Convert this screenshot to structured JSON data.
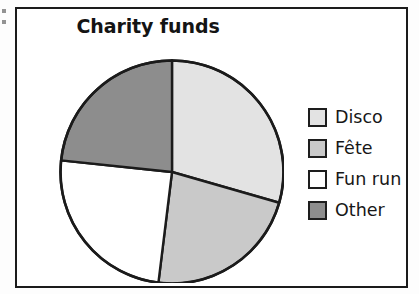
{
  "chart_data": {
    "type": "pie",
    "title": "Charity funds",
    "xlabel": "",
    "ylabel": "",
    "legend_position": "right",
    "grid": false,
    "categories": [
      "Disco",
      "Fête",
      "Fun run",
      "Other"
    ],
    "values": [
      29.4,
      22.5,
      24.7,
      23.4
    ],
    "units": "percent",
    "start_angle_deg": 0,
    "direction": "clockwise",
    "slices": [
      {
        "label": "Disco",
        "value": 29.4,
        "angle_deg": 106,
        "start_deg": 0,
        "end_deg": 106,
        "color": "#e3e3e3"
      },
      {
        "label": "Fête",
        "value": 22.5,
        "angle_deg": 81,
        "start_deg": 106,
        "end_deg": 187,
        "color": "#c9c9c9"
      },
      {
        "label": "Fun run",
        "value": 24.7,
        "angle_deg": 89,
        "start_deg": 187,
        "end_deg": 276,
        "color": "#ffffff"
      },
      {
        "label": "Other",
        "value": 23.4,
        "angle_deg": 84,
        "start_deg": 276,
        "end_deg": 360,
        "color": "#8d8d8d"
      }
    ]
  },
  "chart": {
    "title": "Charity funds",
    "outline_color": "#1b1b1b",
    "frame_color": "#1b1b1b",
    "background": "#ffffff"
  },
  "legend": {
    "items": [
      {
        "label": "Disco",
        "color": "#e3e3e3"
      },
      {
        "label": "Fête",
        "color": "#c9c9c9"
      },
      {
        "label": "Fun run",
        "color": "#ffffff"
      },
      {
        "label": "Other",
        "color": "#8d8d8d"
      }
    ]
  }
}
